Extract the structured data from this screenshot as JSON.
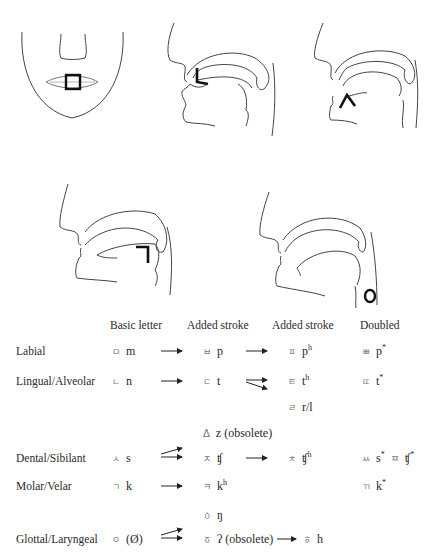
{
  "figures": {
    "labial_mark": "square",
    "alveolar_mark": "ㄴ",
    "sibilant_mark": "ㅅ",
    "velar_mark": "ㄱ",
    "glottal_mark": "ㅇ"
  },
  "table": {
    "headers": [
      "Basic letter",
      "Added stroke",
      "Added stroke",
      "Doubled"
    ],
    "rows": [
      {
        "label": "Labial",
        "basic": {
          "hangul": "ㅁ",
          "ipa": "m"
        },
        "stroke1": {
          "hangul": "ㅂ",
          "ipa": "p"
        },
        "stroke2": {
          "hangul": "ㅍ",
          "ipa": "p",
          "sup": "h"
        },
        "doubled": {
          "hangul": "ㅃ",
          "ipa": "p",
          "sup": "*"
        }
      },
      {
        "label": "Lingual/Alveolar",
        "basic": {
          "hangul": "ㄴ",
          "ipa": "n"
        },
        "stroke1": {
          "hangul": "ㄷ",
          "ipa": "t"
        },
        "stroke2": {
          "hangul": "ㅌ",
          "ipa": "t",
          "sup": "h"
        },
        "stroke2b": {
          "hangul": "ㄹ",
          "ipa": "r/l"
        },
        "doubled": {
          "hangul": "ㄸ",
          "ipa": "t",
          "sup": "*"
        }
      },
      {
        "label": "Dental/Sibilant",
        "extra": {
          "hangul": "Δ",
          "ipa": "z (obsolete)"
        },
        "basic": {
          "hangul": "ㅅ",
          "ipa": "s"
        },
        "stroke1": {
          "hangul": "ㅈ",
          "ipa": "ʧ"
        },
        "stroke2": {
          "hangul": "ㅊ",
          "ipa": "ʧ",
          "sup": "h"
        },
        "doubled": [
          {
            "hangul": "ㅆ",
            "ipa": "s",
            "sup": "*"
          },
          {
            "hangul": "ㅉ",
            "ipa": "ʧ",
            "sup": "*"
          }
        ]
      },
      {
        "label": "Molar/Velar",
        "basic": {
          "hangul": "ㄱ",
          "ipa": "k"
        },
        "stroke1": {
          "hangul": "ㅋ",
          "ipa": "k",
          "sup": "h"
        },
        "doubled": {
          "hangul": "ㄲ",
          "ipa": "k",
          "sup": "*"
        }
      },
      {
        "label": "Glottal/Laryngeal",
        "basic": {
          "hangul": "ㅇ",
          "ipa": "(Ø)"
        },
        "stroke1a": {
          "hangul": "ㆁ",
          "ipa": "ŋ"
        },
        "stroke1": {
          "hangul": "ㆆ",
          "ipa": "ʔ (obsolete)"
        },
        "stroke2": {
          "hangul": "ㅎ",
          "ipa": "h"
        }
      }
    ]
  }
}
